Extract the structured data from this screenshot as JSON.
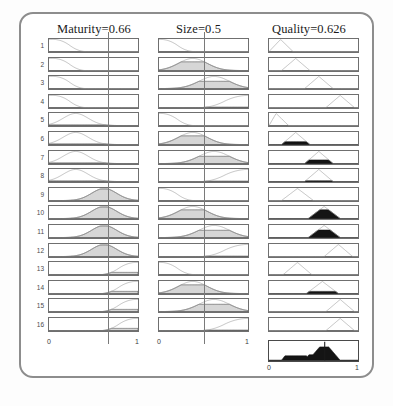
{
  "viewer": {
    "type": "fuzzy-rule-viewer",
    "rule_count": 16,
    "columns": [
      {
        "key": "maturity",
        "title": "Maturity=0.66",
        "name": "Maturity",
        "value": 0.66,
        "role": "input",
        "axis_min": "0",
        "axis_max": "1"
      },
      {
        "key": "size",
        "title": "Size=0.5",
        "name": "Size",
        "value": 0.5,
        "role": "input",
        "axis_min": "0",
        "axis_max": "1"
      },
      {
        "key": "quality",
        "title": "Quality=0.626",
        "name": "Quality",
        "value": 0.626,
        "role": "output",
        "axis_min": "0",
        "axis_max": "1"
      }
    ],
    "rule_numbers": [
      "1",
      "2",
      "3",
      "4",
      "5",
      "6",
      "7",
      "8",
      "9",
      "10",
      "11",
      "12",
      "13",
      "14",
      "15",
      "16"
    ],
    "aggregate": {
      "label_min": "0",
      "label_max": "1",
      "defuzzified": 0.626
    }
  },
  "chart_data": {
    "type": "line",
    "xlabel": "",
    "ylabel": "membership",
    "xlim": [
      0,
      1
    ],
    "ylim": [
      0,
      1
    ],
    "grid": false,
    "legend": "none",
    "input_markers": {
      "maturity": 0.66,
      "size": 0.5
    },
    "output_defuzzified": 0.626,
    "series": [
      {
        "name": "Maturity",
        "variable": "maturity",
        "value": 0.66,
        "membership_functions": [
          {
            "rule": 1,
            "shape": "zmf",
            "params": [
              0.05,
              0.42
            ],
            "fire": 0.0
          },
          {
            "rule": 2,
            "shape": "zmf",
            "params": [
              0.05,
              0.42
            ],
            "fire": 0.0
          },
          {
            "rule": 3,
            "shape": "zmf",
            "params": [
              0.05,
              0.42
            ],
            "fire": 0.0
          },
          {
            "rule": 4,
            "shape": "zmf",
            "params": [
              0.05,
              0.42
            ],
            "fire": 0.0
          },
          {
            "rule": 5,
            "shape": "gaussian",
            "params": [
              0.3,
              0.14
            ],
            "fire": 0.06
          },
          {
            "rule": 6,
            "shape": "gaussian",
            "params": [
              0.3,
              0.14
            ],
            "fire": 0.06
          },
          {
            "rule": 7,
            "shape": "gaussian",
            "params": [
              0.3,
              0.14
            ],
            "fire": 0.06
          },
          {
            "rule": 8,
            "shape": "gaussian",
            "params": [
              0.3,
              0.14
            ],
            "fire": 0.06
          },
          {
            "rule": 9,
            "shape": "gaussian",
            "params": [
              0.62,
              0.14
            ],
            "fire": 0.95
          },
          {
            "rule": 10,
            "shape": "gaussian",
            "params": [
              0.62,
              0.14
            ],
            "fire": 0.95
          },
          {
            "rule": 11,
            "shape": "gaussian",
            "params": [
              0.62,
              0.14
            ],
            "fire": 0.95
          },
          {
            "rule": 12,
            "shape": "gaussian",
            "params": [
              0.62,
              0.14
            ],
            "fire": 0.95
          },
          {
            "rule": 13,
            "shape": "smf",
            "params": [
              0.58,
              0.98
            ],
            "fire": 0.18
          },
          {
            "rule": 14,
            "shape": "smf",
            "params": [
              0.58,
              0.98
            ],
            "fire": 0.18
          },
          {
            "rule": 15,
            "shape": "smf",
            "params": [
              0.58,
              0.98
            ],
            "fire": 0.18
          },
          {
            "rule": 16,
            "shape": "smf",
            "params": [
              0.58,
              0.98
            ],
            "fire": 0.18
          }
        ]
      },
      {
        "name": "Size",
        "variable": "size",
        "value": 0.5,
        "membership_functions": [
          {
            "rule": 1,
            "shape": "zmf",
            "params": [
              0.02,
              0.4
            ],
            "fire": 0.0
          },
          {
            "rule": 2,
            "shape": "gaussian",
            "params": [
              0.38,
              0.16
            ],
            "fire": 0.72
          },
          {
            "rule": 3,
            "shape": "gaussian",
            "params": [
              0.62,
              0.17
            ],
            "fire": 0.6
          },
          {
            "rule": 4,
            "shape": "smf",
            "params": [
              0.46,
              1.0
            ],
            "fire": 0.04
          },
          {
            "rule": 5,
            "shape": "zmf",
            "params": [
              0.02,
              0.4
            ],
            "fire": 0.0
          },
          {
            "rule": 6,
            "shape": "gaussian",
            "params": [
              0.38,
              0.16
            ],
            "fire": 0.72
          },
          {
            "rule": 7,
            "shape": "gaussian",
            "params": [
              0.62,
              0.17
            ],
            "fire": 0.6
          },
          {
            "rule": 8,
            "shape": "smf",
            "params": [
              0.46,
              1.0
            ],
            "fire": 0.04
          },
          {
            "rule": 9,
            "shape": "zmf",
            "params": [
              0.02,
              0.4
            ],
            "fire": 0.0
          },
          {
            "rule": 10,
            "shape": "gaussian",
            "params": [
              0.38,
              0.16
            ],
            "fire": 0.72
          },
          {
            "rule": 11,
            "shape": "gaussian",
            "params": [
              0.62,
              0.17
            ],
            "fire": 0.6
          },
          {
            "rule": 12,
            "shape": "smf",
            "params": [
              0.46,
              1.0
            ],
            "fire": 0.04
          },
          {
            "rule": 13,
            "shape": "zmf",
            "params": [
              0.02,
              0.4
            ],
            "fire": 0.0
          },
          {
            "rule": 14,
            "shape": "gaussian",
            "params": [
              0.38,
              0.16
            ],
            "fire": 0.72
          },
          {
            "rule": 15,
            "shape": "gaussian",
            "params": [
              0.62,
              0.17
            ],
            "fire": 0.6
          },
          {
            "rule": 16,
            "shape": "smf",
            "params": [
              0.46,
              1.0
            ],
            "fire": 0.04
          }
        ]
      },
      {
        "name": "Quality",
        "variable": "quality",
        "value": 0.626,
        "membership_functions": [
          {
            "rule": 1,
            "shape": "triangle",
            "params": [
              0.0,
              0.13,
              0.27
            ],
            "fire": 0.0
          },
          {
            "rule": 2,
            "shape": "triangle",
            "params": [
              0.14,
              0.3,
              0.46
            ],
            "fire": 0.0
          },
          {
            "rule": 3,
            "shape": "triangle",
            "params": [
              0.4,
              0.56,
              0.72
            ],
            "fire": 0.0
          },
          {
            "rule": 4,
            "shape": "triangle",
            "params": [
              0.64,
              0.8,
              0.96
            ],
            "fire": 0.0
          },
          {
            "rule": 5,
            "shape": "triangle",
            "params": [
              0.0,
              0.08,
              0.22
            ],
            "fire": 0.0
          },
          {
            "rule": 6,
            "shape": "triangle",
            "params": [
              0.14,
              0.3,
              0.46
            ],
            "fire": 0.24
          },
          {
            "rule": 7,
            "shape": "triangle",
            "params": [
              0.4,
              0.56,
              0.72
            ],
            "fire": 0.3
          },
          {
            "rule": 8,
            "shape": "triangle",
            "params": [
              0.4,
              0.56,
              0.72
            ],
            "fire": 0.06
          },
          {
            "rule": 9,
            "shape": "triangle",
            "params": [
              0.14,
              0.32,
              0.5
            ],
            "fire": 0.0
          },
          {
            "rule": 10,
            "shape": "triangle",
            "params": [
              0.44,
              0.62,
              0.8
            ],
            "fire": 0.72
          },
          {
            "rule": 11,
            "shape": "triangle",
            "params": [
              0.44,
              0.62,
              0.8
            ],
            "fire": 0.62
          },
          {
            "rule": 12,
            "shape": "triangle",
            "params": [
              0.62,
              0.78,
              0.94
            ],
            "fire": 0.0
          },
          {
            "rule": 13,
            "shape": "triangle",
            "params": [
              0.16,
              0.32,
              0.48
            ],
            "fire": 0.0
          },
          {
            "rule": 14,
            "shape": "triangle",
            "params": [
              0.42,
              0.6,
              0.78
            ],
            "fire": 0.18
          },
          {
            "rule": 15,
            "shape": "triangle",
            "params": [
              0.64,
              0.8,
              0.96
            ],
            "fire": 0.0
          },
          {
            "rule": 16,
            "shape": "triangle",
            "params": [
              0.64,
              0.8,
              0.96
            ],
            "fire": 0.0
          }
        ]
      }
    ],
    "aggregate_output": {
      "variable": "Quality",
      "defuzzified": 0.626,
      "xlim": [
        0,
        1
      ],
      "tick_labels": [
        "0",
        "1"
      ]
    }
  }
}
